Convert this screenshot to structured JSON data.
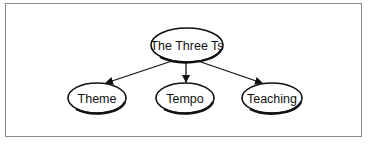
{
  "diagram": {
    "type": "tree",
    "root": {
      "id": "root",
      "label": "The Three Ts"
    },
    "children": [
      {
        "id": "theme",
        "label": "Theme"
      },
      {
        "id": "tempo",
        "label": "Tempo"
      },
      {
        "id": "teaching",
        "label": "Teaching"
      }
    ],
    "edges": [
      {
        "from": "root",
        "to": "theme"
      },
      {
        "from": "root",
        "to": "tempo"
      },
      {
        "from": "root",
        "to": "teaching"
      }
    ]
  }
}
